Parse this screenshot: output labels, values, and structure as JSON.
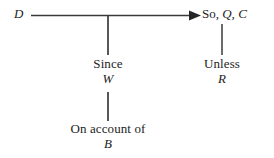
{
  "diagram": {
    "type": "toulmin-argument-model",
    "colors": {
      "background": "#ffffff",
      "ink": "#232323",
      "line": "#3a3a3a"
    },
    "nodes": {
      "datum": {
        "role": "datum",
        "symbol": "D"
      },
      "claim": {
        "role": "claim",
        "connective": "So,",
        "symbol_qualifier": "Q,",
        "symbol_claim": "C",
        "full_text": "So, Q, C"
      },
      "warrant": {
        "role": "warrant",
        "connective": "Since",
        "symbol": "W"
      },
      "backing": {
        "role": "backing",
        "connective": "On account of",
        "symbol": "B"
      },
      "rebuttal": {
        "role": "rebuttal",
        "connective": "Unless",
        "symbol": "R"
      }
    },
    "connectors": [
      {
        "name": "datum-to-claim",
        "from": "datum",
        "to": "claim",
        "style": "arrow",
        "orientation": "horizontal"
      },
      {
        "name": "warrant-to-datum-claim-line",
        "from": "warrant",
        "to": "datum-to-claim",
        "style": "plain",
        "orientation": "vertical"
      },
      {
        "name": "backing-to-warrant",
        "from": "backing",
        "to": "warrant",
        "style": "plain",
        "orientation": "vertical"
      },
      {
        "name": "rebuttal-to-claim",
        "from": "rebuttal",
        "to": "claim",
        "style": "plain",
        "orientation": "vertical"
      }
    ]
  }
}
